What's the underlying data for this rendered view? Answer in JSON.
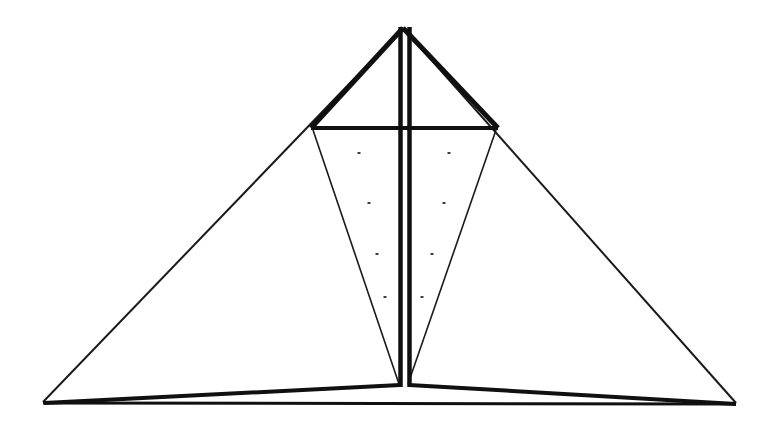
{
  "figure": {
    "background_color": "#ffffff",
    "ink_color": "#101010",
    "canvas": {
      "width": 776,
      "height": 425
    }
  },
  "geometry": {
    "apex": {
      "x": 403,
      "y": 26
    },
    "mast": {
      "left_bar_x": 398.5,
      "right_bar_x": 407.5,
      "bar_width": 4.5,
      "top_y": 27,
      "bottom_y": 387
    },
    "crossbar": {
      "left_x": 311,
      "right_x": 498,
      "y": 128,
      "thickness": 4
    },
    "outer_triangle": {
      "left_base": {
        "x": 43,
        "y": 402
      },
      "right_base": {
        "x": 736,
        "y": 403
      },
      "stroke_width": 2
    },
    "upper_wing_stroke_width": 5,
    "inner_triangle": {
      "left_top": {
        "x": 313,
        "y": 130
      },
      "right_top": {
        "x": 496,
        "y": 130
      },
      "bottom": {
        "x": 403,
        "y": 384
      },
      "stroke_width": 1.6
    },
    "hull": {
      "left_tip": {
        "x": 44,
        "y": 403
      },
      "peak": {
        "x": 403,
        "y": 385
      },
      "right_tip": {
        "x": 736,
        "y": 404
      },
      "stroke_width": 4
    },
    "baseline": {
      "left_x": 43,
      "right_x": 736,
      "y": 403,
      "stroke_width": 3
    }
  },
  "chart_data": {
    "type": "scatter",
    "xlabel": "",
    "ylabel": "",
    "xlim": [
      0,
      776
    ],
    "ylim": [
      425,
      0
    ],
    "grid": false,
    "legend": "none",
    "annotations": [],
    "series": [
      {
        "name": "interior-dots",
        "marker": "square",
        "size": 3,
        "points": [
          {
            "x": 359,
            "y": 153
          },
          {
            "x": 449,
            "y": 153
          },
          {
            "x": 369,
            "y": 203
          },
          {
            "x": 444,
            "y": 203
          },
          {
            "x": 377,
            "y": 254
          },
          {
            "x": 432,
            "y": 254
          },
          {
            "x": 385,
            "y": 297
          },
          {
            "x": 422,
            "y": 297
          }
        ]
      }
    ],
    "paths": [
      {
        "name": "outer-triangle-left-edge",
        "points": [
          {
            "x": 403,
            "y": 28
          },
          {
            "x": 43,
            "y": 402
          }
        ],
        "width": 2
      },
      {
        "name": "outer-triangle-right-edge",
        "points": [
          {
            "x": 403,
            "y": 28
          },
          {
            "x": 736,
            "y": 403
          }
        ],
        "width": 2
      },
      {
        "name": "upper-left-wing",
        "points": [
          {
            "x": 403,
            "y": 28
          },
          {
            "x": 311,
            "y": 128
          }
        ],
        "width": 5
      },
      {
        "name": "upper-right-wing",
        "points": [
          {
            "x": 403,
            "y": 28
          },
          {
            "x": 498,
            "y": 128
          }
        ],
        "width": 5
      },
      {
        "name": "crossbar",
        "points": [
          {
            "x": 311,
            "y": 128
          },
          {
            "x": 498,
            "y": 128
          }
        ],
        "width": 4
      },
      {
        "name": "inner-triangle-left-edge",
        "points": [
          {
            "x": 313,
            "y": 130
          },
          {
            "x": 399,
            "y": 384
          }
        ],
        "width": 1.6
      },
      {
        "name": "inner-triangle-right-edge",
        "points": [
          {
            "x": 496,
            "y": 130
          },
          {
            "x": 408,
            "y": 384
          }
        ],
        "width": 1.6
      },
      {
        "name": "mast-left-bar",
        "points": [
          {
            "x": 400.5,
            "y": 27
          },
          {
            "x": 400.5,
            "y": 387
          }
        ],
        "width": 4.5
      },
      {
        "name": "mast-right-bar",
        "points": [
          {
            "x": 409.5,
            "y": 27
          },
          {
            "x": 409.5,
            "y": 387
          }
        ],
        "width": 4.5
      },
      {
        "name": "hull-left-edge",
        "points": [
          {
            "x": 44,
            "y": 403
          },
          {
            "x": 400,
            "y": 385
          }
        ],
        "width": 4
      },
      {
        "name": "hull-right-edge",
        "points": [
          {
            "x": 409,
            "y": 385
          },
          {
            "x": 736,
            "y": 404
          }
        ],
        "width": 4
      },
      {
        "name": "baseline",
        "points": [
          {
            "x": 43,
            "y": 403
          },
          {
            "x": 736,
            "y": 404
          }
        ],
        "width": 3
      }
    ]
  }
}
